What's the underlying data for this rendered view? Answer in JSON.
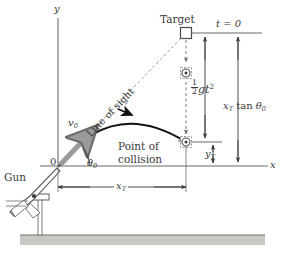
{
  "figure": {
    "axes": {
      "y_label": "y",
      "x_label": "x",
      "origin_label": "0"
    },
    "labels": {
      "gun": "Gun",
      "target": "Target",
      "t_zero": "t = 0",
      "line_of_sight": "Line of sight",
      "point_of_collision_line1": "Point of",
      "point_of_collision_line2": "collision",
      "initial_velocity": "v",
      "initial_velocity_sub": "0",
      "launch_angle": "θ",
      "launch_angle_sub": "0",
      "drop_numerator": "1",
      "drop_denominator": "2",
      "drop_symbol": "gt",
      "drop_exponent": "2",
      "sight_height_main": "x",
      "sight_height_sub": "T",
      "sight_height_tan": " tan ",
      "sight_height_theta": "θ",
      "sight_height_theta_sub": "0",
      "target_height": "y",
      "target_height_sub": "T",
      "range": "x",
      "range_sub": "T"
    },
    "colors": {
      "ink": "#3a3a3a",
      "line": "#555555",
      "trajectory": "#111111",
      "velocity_arrow": "#9a9a9a",
      "ground": "#c9c9c4",
      "dashed": "#8a8a8a"
    },
    "geometry": {
      "origin": [
        58,
        166
      ],
      "target_marker": [
        186,
        33
      ],
      "mid_marker": [
        186,
        73
      ],
      "collision_marker": [
        186,
        142
      ],
      "t0_line_y": 33,
      "collision_line_y": 142,
      "axis_line_y": 166,
      "range_dim_y": 187,
      "drop_dim_x": 205,
      "sight_dim_x": 238,
      "target_height_dim_x": 213,
      "ground_band": [
        20,
        235,
        245,
        265
      ]
    }
  }
}
